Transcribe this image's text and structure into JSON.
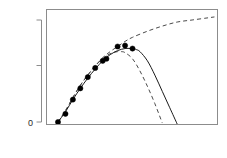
{
  "chart_data": {
    "type": "scatter",
    "title": "",
    "xlabel": "Concentration",
    "ylabel": "Response",
    "xlim": [
      -0.08,
      2.12
    ],
    "ylim": [
      -0.06,
      1.12
    ],
    "grid": false,
    "legend": "none",
    "x_ticks": [
      0,
      1,
      2
    ],
    "x_tick_labels": [
      "0",
      "1",
      "2"
    ],
    "y_ticks": [
      0,
      0.5,
      1.0
    ],
    "y_tick_labels": [
      "0",
      "",
      ""
    ],
    "points": {
      "name": "observed data",
      "marker": "filled-circle",
      "color": "#000000",
      "x": [
        0.0,
        0.1,
        0.2,
        0.3,
        0.4,
        0.5,
        0.6,
        0.65,
        0.8,
        0.9,
        1.0
      ],
      "y": [
        0.0,
        0.08,
        0.22,
        0.33,
        0.44,
        0.53,
        0.6,
        0.62,
        0.74,
        0.75,
        0.72
      ]
    },
    "series": [
      {
        "name": "fitted model (solid)",
        "style": "solid",
        "color": "#1a1a1a",
        "x": [
          0.0,
          0.1,
          0.2,
          0.3,
          0.4,
          0.5,
          0.6,
          0.7,
          0.8,
          0.9,
          1.0,
          1.05,
          1.1,
          1.2,
          1.3,
          1.4,
          1.5,
          1.6
        ],
        "y": [
          0.0,
          0.1,
          0.22,
          0.33,
          0.43,
          0.52,
          0.6,
          0.66,
          0.7,
          0.72,
          0.72,
          0.71,
          0.69,
          0.6,
          0.46,
          0.3,
          0.14,
          -0.02
        ]
      },
      {
        "name": "fitted model (dashed lower)",
        "style": "dashed",
        "color": "#4a4a4a",
        "x": [
          0.0,
          0.1,
          0.2,
          0.3,
          0.4,
          0.5,
          0.6,
          0.7,
          0.8,
          0.85,
          0.9,
          1.0,
          1.1,
          1.2,
          1.3,
          1.4
        ],
        "y": [
          0.0,
          0.11,
          0.24,
          0.36,
          0.46,
          0.55,
          0.62,
          0.67,
          0.69,
          0.69,
          0.68,
          0.62,
          0.5,
          0.35,
          0.18,
          -0.01
        ]
      },
      {
        "name": "saturating model (dashed upper)",
        "style": "dashed",
        "color": "#4a4a4a",
        "x": [
          0.0,
          0.1,
          0.2,
          0.3,
          0.4,
          0.5,
          0.6,
          0.7,
          0.8,
          0.9,
          1.0,
          1.2,
          1.4,
          1.6,
          1.8,
          2.0,
          2.1
        ],
        "y": [
          0.0,
          0.11,
          0.24,
          0.36,
          0.46,
          0.55,
          0.63,
          0.69,
          0.74,
          0.79,
          0.83,
          0.89,
          0.94,
          0.98,
          1.0,
          1.02,
          1.03
        ]
      }
    ]
  },
  "axes": {
    "x_title": "Concentration",
    "y_title": "Response",
    "x_tick_0": "0",
    "x_tick_1": "1",
    "x_tick_2": "2",
    "y_tick_0": "0"
  },
  "colors": {
    "background": "#ffffff",
    "axis": "#8c8c8c",
    "text": "#2b2b2b",
    "solid_curve": "#1a1a1a",
    "dashed_curve": "#4a4a4a",
    "marker": "#000000"
  }
}
